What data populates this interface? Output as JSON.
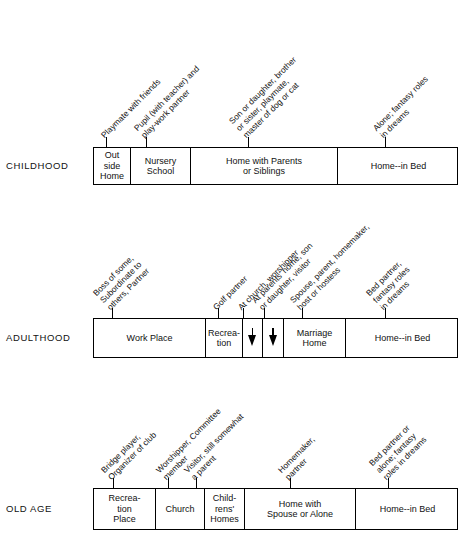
{
  "figure": {
    "type": "role-settings-lifespan-diagram",
    "orientation": "three horizontal bands"
  },
  "bands": [
    {
      "stage": "CHILDHOOD",
      "boxrow_top": 147,
      "boxrow_height": 38,
      "cells": [
        {
          "lines": [
            "Out",
            "side",
            "Home"
          ],
          "left": 0,
          "width": 37
        },
        {
          "lines": [
            "Nursery",
            "School"
          ],
          "left": 37,
          "width": 60
        },
        {
          "lines": [
            "Home with Parents",
            "or Siblings"
          ],
          "left": 97,
          "width": 147
        },
        {
          "lines": [
            "Home--in Bed"
          ],
          "left": 244,
          "width": 121
        }
      ],
      "annotations": [
        {
          "lines": [
            "Playmate with friends"
          ],
          "x": 106,
          "y": 140
        },
        {
          "lines": [
            "Pupil (with teacher) and",
            "play-work partner"
          ],
          "x": 146,
          "y": 140
        },
        {
          "lines": [
            "Son or daughter, brother",
            "or sister, playmate,",
            "master of dog or cat"
          ],
          "x": 248,
          "y": 140
        },
        {
          "lines": [
            "Alone; fantasy roles",
            "in dreams"
          ],
          "x": 385,
          "y": 140
        }
      ]
    },
    {
      "stage": "ADULTHOOD",
      "boxrow_top": 318,
      "boxrow_height": 40,
      "cells": [
        {
          "lines": [
            "Work Place"
          ],
          "left": 0,
          "width": 112
        },
        {
          "lines": [
            "Recrea-",
            "tion"
          ],
          "left": 112,
          "width": 37
        },
        {
          "lines": [],
          "arrow": true,
          "left": 149,
          "width": 20
        },
        {
          "lines": [],
          "arrow": true,
          "left": 169,
          "width": 21
        },
        {
          "lines": [
            "Marriage",
            "Home"
          ],
          "left": 190,
          "width": 62
        },
        {
          "lines": [
            "Home--in Bed"
          ],
          "left": 252,
          "width": 113
        }
      ],
      "annotations": [
        {
          "lines": [
            "Boss of some,",
            "Subordinate to",
            "others, Partner"
          ],
          "x": 112,
          "y": 312
        },
        {
          "lines": [
            "Golf partner"
          ],
          "x": 218,
          "y": 312
        },
        {
          "lines": [
            "At church, worshipper"
          ],
          "x": 243,
          "y": 312
        },
        {
          "lines": [
            "At parents' home, son",
            "or daughter, visitor"
          ],
          "x": 264,
          "y": 312
        },
        {
          "lines": [
            "Spouse, parent, homemaker,",
            "host or hostess"
          ],
          "x": 302,
          "y": 312
        },
        {
          "lines": [
            "Bed partner,",
            "fantasy roles",
            "in dreams"
          ],
          "x": 385,
          "y": 312
        }
      ]
    },
    {
      "stage": "OLD AGE",
      "boxrow_top": 488,
      "boxrow_height": 42,
      "cells": [
        {
          "lines": [
            "Recrea-",
            "tion",
            "Place"
          ],
          "left": 0,
          "width": 62
        },
        {
          "lines": [
            "Church"
          ],
          "left": 62,
          "width": 49
        },
        {
          "lines": [
            "Child-",
            "rens'",
            "Homes"
          ],
          "left": 111,
          "width": 40
        },
        {
          "lines": [
            "Home with",
            "Spouse or Alone"
          ],
          "left": 151,
          "width": 111
        },
        {
          "lines": [
            "Home--in Bed"
          ],
          "left": 262,
          "width": 103
        }
      ],
      "annotations": [
        {
          "lines": [
            "Bridge player,",
            "Organizer of club"
          ],
          "x": 113,
          "y": 482
        },
        {
          "lines": [
            "Worshipper, Committee",
            "member"
          ],
          "x": 168,
          "y": 482
        },
        {
          "lines": [
            "Visitor, still somewhat",
            "a parent"
          ],
          "x": 196,
          "y": 482
        },
        {
          "lines": [
            "Homemaker,",
            "partner"
          ],
          "x": 290,
          "y": 482
        },
        {
          "lines": [
            "Bed partner or",
            "alone; fantasy",
            "roles in dreams"
          ],
          "x": 388,
          "y": 482
        }
      ]
    }
  ],
  "colors": {
    "ink": "#111111",
    "paper": "#ffffff"
  }
}
